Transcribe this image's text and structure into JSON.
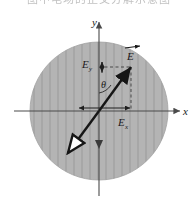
{
  "caption": {
    "text": "图中电场的正交分解示意图"
  },
  "figure": {
    "region_label": "hatched-circular-region",
    "colors": {
      "region_fill": "#b4b4b4",
      "hatch_line": "#9a9a9a",
      "axis": "#4a4a4a",
      "vector": "#161616",
      "dashed_guide": "#3c3c3c",
      "background": "#ffffff",
      "caption_text": "#8e8e8e"
    },
    "axes": {
      "x_label": "x",
      "y_label": "y",
      "origin_label": "O"
    },
    "labels": {
      "field_vector": "E",
      "component_y": "E",
      "component_y_sub": "y",
      "component_x": "E",
      "component_x_sub": "x",
      "angle": "θ"
    },
    "geometry": {
      "circle_center_x": 99,
      "circle_center_y": 111,
      "circle_radius": 69,
      "hatch_spacing": 8,
      "vector_tip_x": 131,
      "vector_tip_y": 66,
      "vector_tail_x": 66,
      "vector_tail_y": 155,
      "angle_from_y_axis_deg": 35
    }
  }
}
